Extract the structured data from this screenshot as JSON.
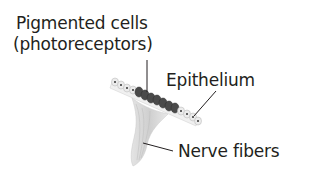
{
  "diagram": {
    "labels": {
      "pigmented_line1": "Pigmented cells",
      "pigmented_line2": "(photoreceptors)",
      "epithelium": "Epithelium",
      "nerve_fibers": "Nerve fibers"
    },
    "colors": {
      "text": "#231f20",
      "pigment": "#4a4a4a",
      "epithelium_cell": "#e6e6e6",
      "nerve": "#d6d6d6"
    }
  }
}
